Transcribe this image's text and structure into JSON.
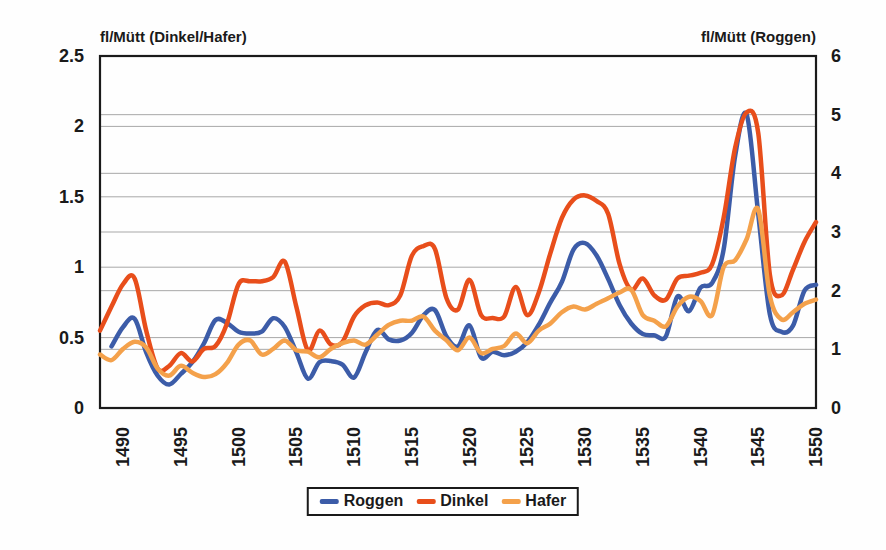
{
  "chart_data": {
    "type": "line",
    "title": "",
    "left_axis": {
      "title": "fl/Mütt (Dinkel/Hafer)",
      "min": 0,
      "max": 2.5,
      "ticks": [
        0,
        0.5,
        1,
        1.5,
        2,
        2.5
      ],
      "tick_labels": [
        "0",
        "0.5",
        "1",
        "1.5",
        "2",
        "2.5"
      ]
    },
    "right_axis": {
      "title": "fl/Mütt (Roggen)",
      "min": 0,
      "max": 6,
      "ticks": [
        0,
        1,
        2,
        3,
        4,
        5,
        6
      ],
      "tick_labels": [
        "0",
        "1",
        "2",
        "3",
        "4",
        "5",
        "6"
      ]
    },
    "x_axis": {
      "start": 1488,
      "end": 1550,
      "ticks": [
        1490,
        1495,
        1500,
        1505,
        1510,
        1515,
        1520,
        1525,
        1530,
        1535,
        1540,
        1545,
        1550
      ],
      "tick_labels": [
        "1490",
        "1495",
        "1500",
        "1505",
        "1510",
        "1515",
        "1520",
        "1525",
        "1530",
        "1535",
        "1540",
        "1545",
        "1550"
      ]
    },
    "grid": true,
    "legend_position": "bottom",
    "series": [
      {
        "name": "Roggen",
        "color": "#3c5ca8",
        "axis": "right",
        "start_year": 1489,
        "values": [
          1.05,
          1.38,
          1.52,
          0.95,
          0.55,
          0.4,
          0.58,
          0.78,
          1.1,
          1.5,
          1.45,
          1.3,
          1.27,
          1.3,
          1.53,
          1.38,
          0.95,
          0.5,
          0.78,
          0.8,
          0.74,
          0.52,
          0.95,
          1.33,
          1.17,
          1.15,
          1.28,
          1.58,
          1.67,
          1.22,
          1.05,
          1.41,
          0.86,
          0.96,
          0.9,
          0.96,
          1.12,
          1.42,
          1.8,
          2.15,
          2.7,
          2.81,
          2.6,
          2.2,
          1.75,
          1.44,
          1.26,
          1.24,
          1.22,
          1.9,
          1.65,
          2.05,
          2.13,
          2.7,
          4.3,
          5.0,
          3.3,
          1.6,
          1.3,
          1.4,
          2.0,
          2.1
        ]
      },
      {
        "name": "Dinkel",
        "color": "#e84e1b",
        "axis": "left",
        "start_year": 1488,
        "values": [
          0.55,
          0.72,
          0.88,
          0.92,
          0.55,
          0.28,
          0.3,
          0.39,
          0.33,
          0.42,
          0.44,
          0.6,
          0.88,
          0.9,
          0.9,
          0.93,
          1.04,
          0.72,
          0.41,
          0.55,
          0.45,
          0.47,
          0.65,
          0.73,
          0.75,
          0.73,
          0.8,
          1.08,
          1.15,
          1.13,
          0.78,
          0.7,
          0.91,
          0.66,
          0.64,
          0.65,
          0.86,
          0.66,
          0.82,
          1.1,
          1.35,
          1.48,
          1.51,
          1.47,
          1.38,
          1.02,
          0.84,
          0.92,
          0.8,
          0.77,
          0.92,
          0.94,
          0.96,
          1.02,
          1.35,
          1.85,
          2.1,
          1.95,
          0.95,
          0.8,
          0.98,
          1.18,
          1.32
        ]
      },
      {
        "name": "Hafer",
        "color": "#f4a14b",
        "axis": "left",
        "start_year": 1488,
        "values": [
          0.38,
          0.34,
          0.42,
          0.47,
          0.43,
          0.28,
          0.23,
          0.3,
          0.25,
          0.22,
          0.24,
          0.32,
          0.45,
          0.48,
          0.38,
          0.42,
          0.48,
          0.41,
          0.4,
          0.36,
          0.42,
          0.46,
          0.48,
          0.45,
          0.52,
          0.59,
          0.62,
          0.62,
          0.65,
          0.55,
          0.48,
          0.41,
          0.5,
          0.39,
          0.42,
          0.44,
          0.53,
          0.46,
          0.55,
          0.6,
          0.68,
          0.72,
          0.7,
          0.74,
          0.78,
          0.82,
          0.84,
          0.66,
          0.62,
          0.58,
          0.72,
          0.79,
          0.76,
          0.66,
          1.0,
          1.05,
          1.2,
          1.41,
          0.8,
          0.63,
          0.68,
          0.74,
          0.77
        ]
      }
    ]
  }
}
